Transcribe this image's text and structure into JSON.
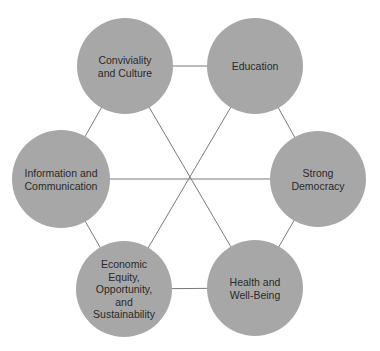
{
  "diagram": {
    "type": "hexagonal-network",
    "colors": {
      "node_fill": "#a7a7a7",
      "edge": "#7a7a7a",
      "background": "#ffffff",
      "text": "#2a2a2a"
    },
    "center": {
      "x": 190,
      "y": 178
    },
    "nodes": [
      {
        "id": "conviviality",
        "label": "Conviviality\nand Culture",
        "x": 125,
        "y": 66,
        "r": 48
      },
      {
        "id": "education",
        "label": "Education",
        "x": 255,
        "y": 66,
        "r": 48
      },
      {
        "id": "strong-democracy",
        "label": "Strong\nDemocracy",
        "x": 318,
        "y": 179,
        "r": 48
      },
      {
        "id": "health",
        "label": "Health and\nWell-Being",
        "x": 255,
        "y": 288,
        "r": 48
      },
      {
        "id": "economic",
        "label": "Economic\nEquity,\nOpportunity,\nand\nSustainability",
        "x": 124,
        "y": 289,
        "r": 48
      },
      {
        "id": "information",
        "label": "Information and\nCommunication",
        "x": 61,
        "y": 179,
        "r": 49
      }
    ],
    "edges": [
      [
        "conviviality",
        "education"
      ],
      [
        "education",
        "strong-democracy"
      ],
      [
        "strong-democracy",
        "health"
      ],
      [
        "health",
        "economic"
      ],
      [
        "economic",
        "information"
      ],
      [
        "information",
        "conviviality"
      ],
      [
        "conviviality",
        "health"
      ],
      [
        "education",
        "economic"
      ],
      [
        "information",
        "strong-democracy"
      ]
    ]
  }
}
